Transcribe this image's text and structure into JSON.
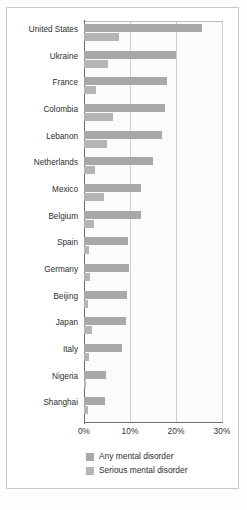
{
  "chart_data": {
    "type": "bar",
    "orientation": "horizontal",
    "title": "",
    "xlabel": "",
    "ylabel": "",
    "xlim": [
      0,
      30
    ],
    "xticks": [
      "0%",
      "10%",
      "20%",
      "30%"
    ],
    "xtick_values": [
      0,
      10,
      20,
      30
    ],
    "grid": "vertical",
    "legend_position": "bottom",
    "categories": [
      "United States",
      "Ukraine",
      "France",
      "Colombia",
      "Lebanon",
      "Netherlands",
      "Mexico",
      "Belgium",
      "Spain",
      "Germany",
      "Beijing",
      "Japan",
      "Italy",
      "Nigeria",
      "Shanghai"
    ],
    "series": [
      {
        "name": "Any mental disorder",
        "color": "#a8a8a8",
        "values": [
          25.7,
          20.0,
          18.0,
          17.5,
          16.9,
          14.9,
          12.3,
          12.3,
          9.5,
          9.7,
          9.3,
          9.1,
          8.2,
          4.7,
          4.5
        ]
      },
      {
        "name": "Serious mental disorder",
        "color": "#b5b5b5",
        "values": [
          7.7,
          5.2,
          2.7,
          6.3,
          5.0,
          2.4,
          4.3,
          2.2,
          1.1,
          1.3,
          0.9,
          1.7,
          1.1,
          0.4,
          0.9
        ]
      }
    ]
  },
  "legend": {
    "items": [
      {
        "label": "Any mental disorder",
        "color": "#a8a8a8"
      },
      {
        "label": "Serious mental disorder",
        "color": "#b5b5b5"
      }
    ]
  },
  "caption": ""
}
